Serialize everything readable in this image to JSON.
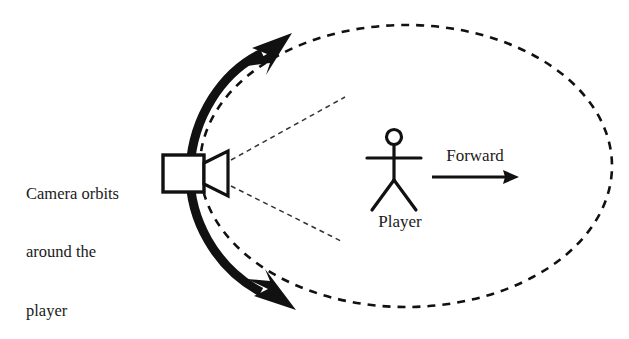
{
  "diagram": {
    "background_color": "#ffffff",
    "stroke_color": "#111111",
    "labels": {
      "camera_orbit_line1": "Camera orbits",
      "camera_orbit_line2": "around the",
      "camera_orbit_line3": "player",
      "player": "Player",
      "forward": "Forward"
    },
    "elements": {
      "orbit_path_name": "dashed-orbit-ellipse",
      "orbit_arc_name": "thick-orbit-arc",
      "camera_name": "camera-icon",
      "player_name": "player-stick-figure",
      "frustum_name": "camera-view-frustum",
      "forward_arrow_name": "forward-arrow"
    },
    "geometry": {
      "ellipse_center_x": 406,
      "ellipse_center_y": 166,
      "ellipse_radius_x": 206,
      "ellipse_radius_y": 141,
      "orbit_dash": "8 7",
      "orbit_stroke_width": 2.6,
      "frustum_dash": "5 4",
      "frustum_stroke_width": 1.5,
      "arc_stroke_width": 9,
      "camera_body_x": 163,
      "camera_body_y": 155,
      "camera_body_width": 41,
      "camera_body_height": 37,
      "player_head_cx": 394,
      "player_head_cy": 137,
      "player_head_r": 7.5,
      "forward_arrow_x1": 432,
      "forward_arrow_x2": 512,
      "forward_arrow_y": 177
    }
  }
}
